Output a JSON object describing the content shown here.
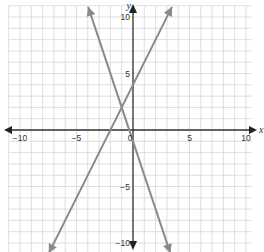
{
  "chart_data": {
    "type": "line",
    "title": "",
    "xlabel": "x",
    "ylabel": "y",
    "xlim": [
      -10,
      10
    ],
    "ylim": [
      -10,
      10
    ],
    "grid": true,
    "x_ticks": [
      -10,
      -5,
      0,
      5,
      10
    ],
    "y_ticks": [
      -10,
      -5,
      5,
      10
    ],
    "tick_labels": {
      "x": [
        "-10",
        "-5",
        "0",
        "5",
        "10"
      ],
      "y": [
        "-10",
        "-5",
        "5",
        "10"
      ]
    },
    "series": [
      {
        "name": "line-rising",
        "equation": "y = 2x + 4",
        "slope": 2,
        "intercept": 4,
        "color": "#8a8a8a"
      },
      {
        "name": "line-falling",
        "equation": "y = -3x - 1",
        "slope": -3,
        "intercept": -1,
        "color": "#8a8a8a"
      }
    ],
    "intersection": [
      -1,
      2
    ]
  },
  "labels": {
    "x_axis": "x",
    "y_axis": "y",
    "origin": "0"
  }
}
